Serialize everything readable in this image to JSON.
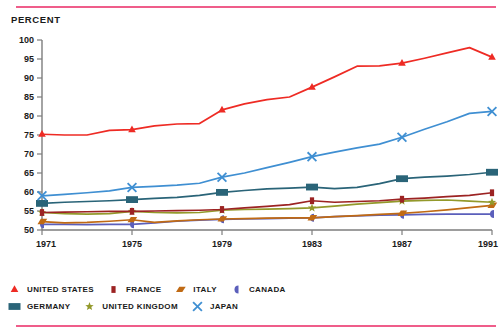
{
  "figure": {
    "axis_title": "PERCENT",
    "rule_color": "#ef5d8a"
  },
  "chart_data": {
    "type": "line",
    "title": "PERCENT",
    "xlabel": "",
    "ylabel": "PERCENT",
    "ylim": [
      50,
      100
    ],
    "xlim": [
      1971,
      1991
    ],
    "grid": false,
    "legend_position": "below",
    "yticks": [
      50,
      55,
      60,
      65,
      70,
      75,
      80,
      85,
      90,
      95,
      100
    ],
    "xticks": [
      1971,
      1975,
      1979,
      1983,
      1987,
      1991
    ],
    "x": [
      1971,
      1972,
      1973,
      1974,
      1975,
      1976,
      1977,
      1978,
      1979,
      1980,
      1981,
      1982,
      1983,
      1984,
      1985,
      1986,
      1987,
      1988,
      1989,
      1990,
      1991
    ],
    "series": [
      {
        "name": "UNITED STATES",
        "color": "#ee2b24",
        "marker": "triangle",
        "values": [
          75.2,
          75.0,
          75.0,
          76.2,
          76.4,
          77.4,
          77.9,
          78.0,
          81.6,
          83.2,
          84.3,
          85.0,
          87.6,
          90.3,
          93.1,
          93.2,
          93.9,
          95.2,
          96.6,
          98.0,
          95.5
        ]
      },
      {
        "name": "FRANCE",
        "color": "#9c2323",
        "marker": "square",
        "values": [
          54.6,
          54.7,
          54.8,
          54.9,
          54.9,
          55.0,
          55.1,
          55.2,
          55.4,
          55.8,
          56.2,
          56.7,
          57.7,
          57.3,
          57.5,
          57.7,
          58.1,
          58.4,
          58.8,
          59.1,
          59.8
        ]
      },
      {
        "name": "ITALY",
        "color": "#c06a14",
        "marker": "parallelogram",
        "values": [
          52.2,
          51.9,
          52.0,
          52.3,
          52.7,
          52.0,
          52.4,
          52.7,
          52.9,
          53.0,
          53.1,
          53.2,
          53.2,
          53.5,
          53.8,
          54.1,
          54.4,
          54.8,
          55.3,
          55.9,
          56.5
        ]
      },
      {
        "name": "CANADA",
        "color": "#5b5fbb",
        "marker": "halfcircle",
        "values": [
          51.5,
          51.5,
          51.4,
          51.5,
          51.5,
          51.9,
          52.3,
          52.6,
          52.8,
          52.9,
          53.0,
          53.1,
          53.2,
          53.5,
          53.7,
          53.9,
          54.0,
          54.1,
          54.2,
          54.2,
          54.2
        ]
      },
      {
        "name": "GERMANY",
        "color": "#2a6478",
        "marker": "rect",
        "values": [
          57.0,
          57.3,
          57.5,
          57.7,
          58.0,
          58.3,
          58.6,
          59.1,
          59.9,
          60.4,
          60.8,
          61.0,
          61.3,
          60.9,
          61.2,
          62.2,
          63.5,
          63.9,
          64.2,
          64.6,
          65.2
        ]
      },
      {
        "name": "UNITED KINGDOM",
        "color": "#93992b",
        "marker": "star",
        "values": [
          54.6,
          54.3,
          54.2,
          54.3,
          54.9,
          54.6,
          54.5,
          54.6,
          55.2,
          55.4,
          55.5,
          55.6,
          55.8,
          56.3,
          56.8,
          57.2,
          57.6,
          57.8,
          57.9,
          57.6,
          57.3
        ]
      },
      {
        "name": "JAPAN",
        "color": "#3f8fd2",
        "marker": "x",
        "values": [
          59.0,
          59.4,
          59.8,
          60.3,
          61.2,
          61.5,
          61.8,
          62.3,
          63.9,
          65.0,
          66.4,
          67.8,
          69.3,
          70.5,
          71.6,
          72.6,
          74.4,
          76.5,
          78.5,
          80.7,
          81.2
        ]
      }
    ]
  },
  "legend": {
    "row1": [
      {
        "label": "UNITED STATES",
        "marker": "triangle",
        "color": "#ee2b24"
      },
      {
        "label": "FRANCE",
        "marker": "square",
        "color": "#9c2323"
      },
      {
        "label": "ITALY",
        "marker": "parallelogram",
        "color": "#c06a14"
      },
      {
        "label": "CANADA",
        "marker": "halfcircle",
        "color": "#5b5fbb"
      }
    ],
    "row2": [
      {
        "label": "GERMANY",
        "marker": "rect",
        "color": "#2a6478"
      },
      {
        "label": "UNITED KINGDOM",
        "marker": "star",
        "color": "#93992b"
      },
      {
        "label": "JAPAN",
        "marker": "x",
        "color": "#3f8fd2"
      }
    ]
  }
}
